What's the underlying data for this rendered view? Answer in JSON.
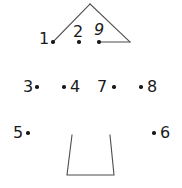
{
  "puzzle": {
    "type": "connect-the-dots",
    "background_color": "#ffffff",
    "ink_color": "#1a1a1a",
    "line_color": "#4d4d4d",
    "dots": [
      {
        "number": "1",
        "label_x": 39,
        "label_y": 31,
        "dot_x": 53,
        "dot_y": 42,
        "style": "plain"
      },
      {
        "number": "2",
        "label_x": 73,
        "label_y": 24,
        "dot_x": 79,
        "dot_y": 42,
        "style": "plain"
      },
      {
        "number": "9",
        "label_x": 94,
        "label_y": 22,
        "dot_x": 99,
        "dot_y": 42,
        "style": "slanted"
      },
      {
        "number": "3",
        "label_x": 23,
        "label_y": 79,
        "dot_x": 37,
        "dot_y": 87,
        "style": "plain"
      },
      {
        "number": "4",
        "label_x": 70,
        "label_y": 79,
        "dot_x": 64,
        "dot_y": 87,
        "style": "plain"
      },
      {
        "number": "7",
        "label_x": 97,
        "label_y": 79,
        "dot_x": 114,
        "dot_y": 87,
        "style": "plain"
      },
      {
        "number": "8",
        "label_x": 147,
        "label_y": 79,
        "dot_x": 141,
        "dot_y": 87,
        "style": "plain"
      },
      {
        "number": "5",
        "label_x": 13,
        "label_y": 125,
        "dot_x": 28,
        "dot_y": 133,
        "style": "plain"
      },
      {
        "number": "6",
        "label_x": 160,
        "label_y": 125,
        "dot_x": 154,
        "dot_y": 133,
        "style": "plain"
      }
    ],
    "strokes": [
      {
        "name": "roof-left-edge",
        "points": "53,42 90,4"
      },
      {
        "name": "roof-right-edge",
        "points": "90,4 130,42"
      },
      {
        "name": "roof-base-line",
        "points": "99,42 130,42"
      },
      {
        "name": "trunk-outline",
        "points": "72,135 67,175 114,175 110,135"
      }
    ]
  }
}
